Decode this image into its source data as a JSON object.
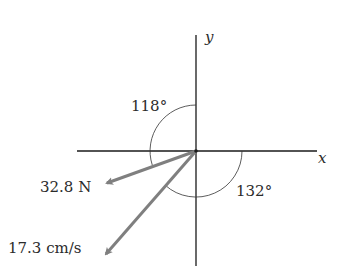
{
  "diagram": {
    "axes": {
      "x_label": "x",
      "y_label": "y"
    },
    "vectors": [
      {
        "label": "32.8 N",
        "angle_from_positive_x_deg": 198
      },
      {
        "label": "17.3 cm/s",
        "angle_from_positive_x_deg": 228
      }
    ],
    "angles": [
      {
        "label": "118°",
        "description": "measured counterclockwise from +y axis to the 32.8 N vector"
      },
      {
        "label": "132°",
        "description": "measured clockwise from +x axis to the 17.3 cm/s vector"
      }
    ],
    "colors": {
      "axis": "#1a1a1a",
      "vector": "#7f7f7f",
      "arc": "#333333",
      "text": "#2b2b2b"
    }
  }
}
